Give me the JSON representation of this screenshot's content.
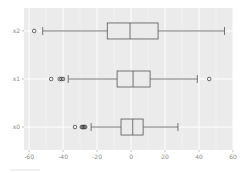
{
  "chart_data": {
    "type": "boxplot",
    "orientation": "horizontal",
    "title": "",
    "xlabel": "",
    "ylabel": "",
    "xlim": [
      -63,
      60
    ],
    "x_ticks": [
      -60,
      -40,
      -20,
      0,
      20,
      40,
      60
    ],
    "x_tick_labels": [
      "-60",
      "-40",
      "-20",
      "0",
      "20",
      "40",
      "60"
    ],
    "categories": [
      "x2",
      "x1",
      "x0"
    ],
    "grid": true,
    "style": "ggplot",
    "series": [
      {
        "name": "x2",
        "whisker_low": -52,
        "q1": -14,
        "median": -0.6,
        "q3": 15.9,
        "whisker_high": 55,
        "outliers": [
          -57
        ]
      },
      {
        "name": "x1",
        "whisker_low": -37,
        "q1": -8.2,
        "median": 1.2,
        "q3": 11.2,
        "whisker_high": 39,
        "outliers": [
          -47,
          -42,
          -41,
          -40,
          46
        ]
      },
      {
        "name": "x0",
        "whisker_low": -23.5,
        "q1": -5.9,
        "median": 1.0,
        "q3": 7.1,
        "whisker_high": 27.6,
        "outliers": [
          -33,
          -29,
          -28.5,
          -28,
          -27.5,
          -27
        ]
      }
    ]
  },
  "colors": {
    "panel_bg": "#ebebeb",
    "grid": "#ffffff",
    "box_edge": "#555555",
    "box_fill": "#ebebeb",
    "median": "#555555",
    "tick_label": "#8a8a8a"
  }
}
